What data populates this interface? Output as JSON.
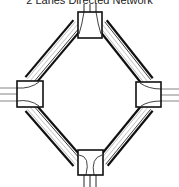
{
  "title": "2 Lanes Directed Network",
  "colors": {
    "background": "#ffffff",
    "road_edge": "#111111",
    "lane_line": "#aaaaaa",
    "junction_fill": "#ffffff",
    "junction_stroke": "#111111",
    "stub_line": "#777777"
  },
  "junctions": [
    {
      "id": "top",
      "x": 78,
      "y": 12,
      "w": 24,
      "h": 26
    },
    {
      "id": "left",
      "x": 17,
      "y": 81,
      "w": 26,
      "h": 26
    },
    {
      "id": "right",
      "x": 136,
      "y": 82,
      "w": 25,
      "h": 25
    },
    {
      "id": "bottom",
      "x": 78,
      "y": 150,
      "w": 25,
      "h": 25
    }
  ],
  "roads": [
    {
      "id": "top-left",
      "from": [
        78,
        24
      ],
      "to": [
        30,
        81
      ]
    },
    {
      "id": "top-right",
      "from": [
        102,
        24
      ],
      "to": [
        148,
        82
      ]
    },
    {
      "id": "left-bottom",
      "from": [
        30,
        107
      ],
      "to": [
        78,
        162
      ]
    },
    {
      "id": "right-bottom",
      "from": [
        148,
        107
      ],
      "to": [
        103,
        162
      ]
    }
  ],
  "stubs": {
    "top": [
      84,
      90,
      96
    ],
    "bottom": [
      84,
      90,
      96
    ],
    "left": [
      88,
      94,
      101
    ],
    "right": [
      89,
      95,
      101
    ]
  }
}
